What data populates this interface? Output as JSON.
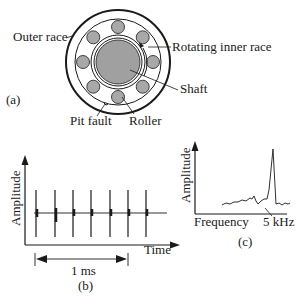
{
  "panel_a": {
    "tag": "(a)",
    "labels": {
      "outer_race": "Outer race",
      "rotating_inner_race": "Rotating inner race",
      "shaft": "Shaft",
      "pit_fault": "Pit fault",
      "roller": "Roller"
    },
    "roller_count": 8,
    "colors": {
      "roller_fill": "#a8a8a8",
      "shaft_fill": "#a0a0a0",
      "stroke": "#1a1a1a"
    }
  },
  "panel_b": {
    "tag": "(b)",
    "ylabel": "Amplitude",
    "xlabel": "Time",
    "interval_label": "1 ms",
    "impulse_count": 7
  },
  "panel_c": {
    "tag": "(c)",
    "ylabel": "Amplitude",
    "xlabel": "Frequency",
    "peak_label": "5 kHz"
  }
}
